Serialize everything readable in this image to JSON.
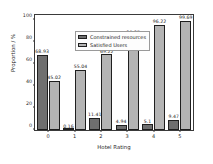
{
  "chart_data": {
    "type": "bar",
    "title": "",
    "xlabel": "Hotel Rating",
    "ylabel": "Proportion / %",
    "categories": [
      "0",
      "1",
      "2",
      "3",
      "4",
      "5"
    ],
    "ylim": [
      0,
      105
    ],
    "yticks": [
      0,
      20,
      40,
      60,
      80,
      100
    ],
    "grid": false,
    "legend_position": "upper left",
    "series": [
      {
        "name": "Constrained resources",
        "color": "#6f6f6f",
        "values": [
          68.93,
          0.16,
          11.41,
          4.94,
          5.1,
          9.47
        ],
        "labels": [
          "68.93",
          "0.16",
          "11.41",
          "4.94",
          "5.1",
          "9.47"
        ]
      },
      {
        "name": "Satisfied Users",
        "color": "#b4b4b4",
        "values": [
          45.02,
          55.04,
          69.22,
          86.37,
          96.22,
          99.69
        ],
        "labels": [
          "45.02",
          "55.04",
          "69.22",
          "86.37",
          "96.22",
          "99.69"
        ]
      }
    ]
  },
  "axes": {
    "ytick_labels": [
      "0",
      "20",
      "40",
      "60",
      "80",
      "100"
    ],
    "xtick_labels": [
      "0",
      "1",
      "2",
      "3",
      "4",
      "5"
    ],
    "xlabel": "Hotel Rating",
    "ylabel": "Proportion / %"
  },
  "legend": {
    "items": [
      {
        "label": "Constrained resources",
        "color": "#6f6f6f"
      },
      {
        "label": "Satisfied Users",
        "color": "#b4b4b4"
      }
    ]
  }
}
